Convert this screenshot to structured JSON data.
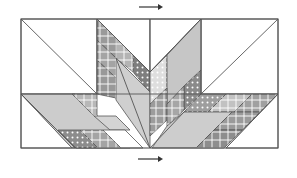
{
  "diagram": {
    "type": "quilt-block-assembly",
    "frame": {
      "x": 21,
      "y": 19,
      "width": 257,
      "height": 129
    },
    "colors": {
      "background": "#ffffff",
      "seam": "#555555",
      "arrow": "#333333",
      "light_gray": "#c8c8c8",
      "mid_gray": "#a8a8a8",
      "dark_gray": "#8a8a8a",
      "pale_gray": "#dcdcdc"
    },
    "arrows": [
      {
        "name": "top-press-arrow",
        "direction": "right",
        "x1": 139,
        "x2": 163,
        "y": 7
      },
      {
        "name": "bottom-press-arrow",
        "direction": "right",
        "x1": 138,
        "x2": 163,
        "y": 159
      }
    ],
    "pieces": [
      {
        "name": "top-left-triangle-white",
        "points": "21,19 97,19 97,94 21,94",
        "fill": "#ffffff"
      },
      {
        "name": "top-right-triangle-white",
        "points": "201,19 278,19 278,94 201,94",
        "fill": "#ffffff"
      },
      {
        "name": "center-left-top-white",
        "points": "97,19 150,19 150,72",
        "fill": "#ffffff"
      },
      {
        "name": "center-right-top-white",
        "points": "150,19 201,19 150,72",
        "fill": "#ffffff"
      },
      {
        "name": "left-strip-1-floral",
        "points": "97,19 116,38 116,58 97,40",
        "fill": "#9a9a9a"
      },
      {
        "name": "left-strip-2-plaid",
        "points": "116,38 133,55 133,72 116,58",
        "fill": "#b4b4b4"
      },
      {
        "name": "left-strip-3-dots",
        "points": "133,55 150,72 150,92 133,72",
        "fill": "#7e7e7e"
      },
      {
        "name": "left-strip-4-plaid",
        "points": "97,40 116,58 116,78 97,60",
        "fill": "#a4a4a4"
      },
      {
        "name": "left-strip-5-floral",
        "points": "97,60 116,78 116,98 97,94",
        "fill": "#999999"
      },
      {
        "name": "center-left-stem",
        "points": "116,58 150,92 150,148 116,100",
        "fill": "#cfcfcf"
      },
      {
        "name": "right-strip-1-dots",
        "points": "150,72 167,55 167,88 150,104",
        "fill": "#dedede"
      },
      {
        "name": "right-strip-2-solid",
        "points": "167,55 201,19 201,70 167,104",
        "fill": "#c6c6c6"
      },
      {
        "name": "right-strip-3-dots",
        "points": "184,86 201,70 201,94 184,110",
        "fill": "#8a8a8a"
      },
      {
        "name": "right-strip-4-plaid",
        "points": "150,104 167,88 167,120 150,136",
        "fill": "#9c9c9c"
      },
      {
        "name": "right-strip-5-floral",
        "points": "167,104 184,86 184,110 167,126",
        "fill": "#a6a6a6"
      },
      {
        "name": "bottom-left-white",
        "points": "21,94 21,148 72,148",
        "fill": "#ffffff"
      },
      {
        "name": "bottom-left-long-strip",
        "points": "21,94 75,94 130,148 72,148",
        "fill": "#cccccc"
      },
      {
        "name": "bottom-left-plaid-strip",
        "points": "72,94 97,94 97,116 94,116",
        "fill": "#b8b8b8"
      },
      {
        "name": "bottom-left-light-strip",
        "points": "94,116 116,116 130,130 110,130",
        "fill": "#d4d4d4"
      },
      {
        "name": "bottom-left-dots-strip",
        "points": "58,130 80,130 98,148 76,148",
        "fill": "#8c8c8c"
      },
      {
        "name": "bottom-left-plaid-strip-2",
        "points": "80,130 103,130 121,148 98,148",
        "fill": "#a4a4a4"
      },
      {
        "name": "bottom-left-white-2",
        "points": "103,130 125,130 143,148 121,148",
        "fill": "#ffffff"
      },
      {
        "name": "bottom-right-white",
        "points": "278,94 278,148 226,148",
        "fill": "#ffffff"
      },
      {
        "name": "bottom-right-dots-strip",
        "points": "201,94 226,94 208,112 184,112",
        "fill": "#9e9e9e"
      },
      {
        "name": "bottom-right-floral-strip",
        "points": "226,94 252,94 234,112 208,112",
        "fill": "#c2c2c2"
      },
      {
        "name": "bottom-right-plaid-strip",
        "points": "252,94 278,94 260,112 234,112",
        "fill": "#a0a0a0"
      },
      {
        "name": "bottom-right-long-strip",
        "points": "167,126 184,112 232,112 196,148 152,148",
        "fill": "#cdcdcd"
      },
      {
        "name": "bottom-right-plaid-strip-2",
        "points": "232,112 260,112 242,130 214,130",
        "fill": "#9a9a9a"
      },
      {
        "name": "bottom-right-floral-strip-2",
        "points": "214,130 242,130 224,148 196,148",
        "fill": "#8e8e8e"
      }
    ],
    "seams": [
      {
        "name": "left-diagonal-top",
        "points": "21,19 97,94"
      },
      {
        "name": "right-diagonal-top",
        "points": "278,19 201,94"
      },
      {
        "name": "center-vertical-top",
        "points": "150,19 150,72"
      },
      {
        "name": "left-vertical",
        "points": "97,19 97,94"
      },
      {
        "name": "right-vertical",
        "points": "201,19 201,94"
      },
      {
        "name": "mid-horizontal",
        "points": "21,94 278,94"
      },
      {
        "name": "center-v-left",
        "points": "97,19 150,72"
      },
      {
        "name": "center-v-right",
        "points": "201,19 150,72"
      },
      {
        "name": "bottom-left-diagonal",
        "points": "21,94 75,148"
      },
      {
        "name": "bottom-right-diagonal",
        "points": "278,94 226,148"
      },
      {
        "name": "stem-left-edge",
        "points": "116,58 150,148"
      },
      {
        "name": "stem-right-edge",
        "points": "184,112 150,148"
      }
    ]
  }
}
